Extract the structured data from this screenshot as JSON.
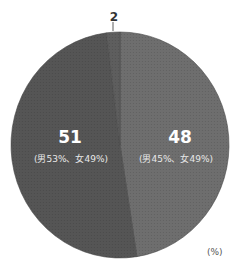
{
  "chart_data": {
    "type": "pie",
    "title": "",
    "unit": "(%)",
    "start_angle": "12 o'clock, clockwise",
    "slices": [
      {
        "label": "48",
        "value": 48,
        "sublabel": "(男45%、女49%)",
        "color": "#6e6e6e"
      },
      {
        "label": "51",
        "value": 51,
        "sublabel": "(男53%、女49%)",
        "color": "#555555"
      },
      {
        "label": "2",
        "value": 2,
        "sublabel": "",
        "color": "#5e5e5e"
      }
    ]
  },
  "labels": {
    "small_slice": "2",
    "left_value": "51",
    "left_detail": "(男53%、女49%)",
    "right_value": "48",
    "right_detail": "(男45%、女49%)",
    "unit": "(%)"
  },
  "colors": {
    "slice_right": "#6e6e6e",
    "slice_left": "#555555",
    "slice_small": "#5e5e5e",
    "divider": "#4a4a4a",
    "leader": "#333333"
  }
}
